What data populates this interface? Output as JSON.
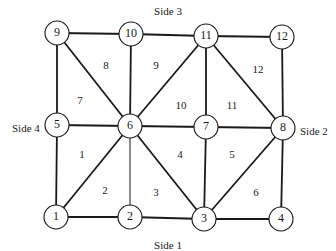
{
  "diagram": {
    "type": "finite-element-mesh",
    "sides": [
      {
        "id": "side-1",
        "label": "Side 1",
        "x": 168,
        "y": 246
      },
      {
        "id": "side-2",
        "label": "Side 2",
        "x": 300,
        "y": 132
      },
      {
        "id": "side-3",
        "label": "Side 3",
        "x": 168,
        "y": 12
      },
      {
        "id": "side-4",
        "label": "Side 4",
        "x": 12,
        "y": 129
      }
    ],
    "nodes": [
      {
        "id": 1,
        "label": "1",
        "x": 56,
        "y": 217
      },
      {
        "id": 2,
        "label": "2",
        "x": 130,
        "y": 217
      },
      {
        "id": 3,
        "label": "3",
        "x": 204,
        "y": 219
      },
      {
        "id": 4,
        "label": "4",
        "x": 281,
        "y": 219
      },
      {
        "id": 5,
        "label": "5",
        "x": 57,
        "y": 125
      },
      {
        "id": 6,
        "label": "6",
        "x": 130,
        "y": 126
      },
      {
        "id": 7,
        "label": "7",
        "x": 206,
        "y": 127
      },
      {
        "id": 8,
        "label": "8",
        "x": 283,
        "y": 128
      },
      {
        "id": 9,
        "label": "9",
        "x": 57,
        "y": 33
      },
      {
        "id": 10,
        "label": "10",
        "x": 131,
        "y": 34
      },
      {
        "id": 11,
        "label": "11",
        "x": 206,
        "y": 36
      },
      {
        "id": 12,
        "label": "12",
        "x": 282,
        "y": 37
      }
    ],
    "edges": [
      [
        1,
        2
      ],
      [
        2,
        3
      ],
      [
        3,
        4
      ],
      [
        5,
        6
      ],
      [
        6,
        7
      ],
      [
        7,
        8
      ],
      [
        9,
        10
      ],
      [
        10,
        11
      ],
      [
        11,
        12
      ],
      [
        1,
        5
      ],
      [
        5,
        9
      ],
      [
        2,
        6,
        "thin"
      ],
      [
        6,
        10
      ],
      [
        3,
        7
      ],
      [
        7,
        11
      ],
      [
        4,
        8
      ],
      [
        8,
        12
      ],
      [
        1,
        6
      ],
      [
        6,
        3
      ],
      [
        6,
        9
      ],
      [
        6,
        11
      ],
      [
        3,
        8
      ],
      [
        11,
        8
      ]
    ],
    "elements": [
      {
        "label": "1",
        "x": 82,
        "y": 155
      },
      {
        "label": "2",
        "x": 105,
        "y": 191
      },
      {
        "label": "3",
        "x": 156,
        "y": 193
      },
      {
        "label": "4",
        "x": 180,
        "y": 155
      },
      {
        "label": "5",
        "x": 232,
        "y": 155
      },
      {
        "label": "6",
        "x": 256,
        "y": 193
      },
      {
        "label": "7",
        "x": 80,
        "y": 101
      },
      {
        "label": "8",
        "x": 106,
        "y": 66
      },
      {
        "label": "9",
        "x": 156,
        "y": 66
      },
      {
        "label": "10",
        "x": 181,
        "y": 106
      },
      {
        "label": "11",
        "x": 232,
        "y": 106
      },
      {
        "label": "12",
        "x": 258,
        "y": 70
      }
    ]
  }
}
